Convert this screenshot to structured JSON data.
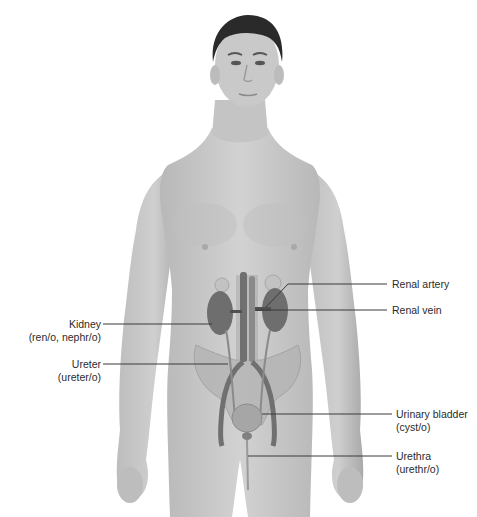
{
  "figure": {
    "colors": {
      "skin": "#c8c8c8",
      "skin_shade": "#b3b3b3",
      "hair": "#2a2a2a",
      "organ_dark": "#6e6e6e",
      "organ_mid": "#9a9a9a",
      "leader_line": "#3a3a3a",
      "text": "#2b2b2b"
    }
  },
  "labels": {
    "left": [
      {
        "name": "Kidney",
        "combining_form": "(ren/o, nephr/o)"
      },
      {
        "name": "Ureter",
        "combining_form": "(ureter/o)"
      }
    ],
    "right": [
      {
        "name": "Renal artery",
        "combining_form": ""
      },
      {
        "name": "Renal vein",
        "combining_form": ""
      },
      {
        "name": "Urinary bladder",
        "combining_form": "(cyst/o)"
      },
      {
        "name": "Urethra",
        "combining_form": "(urethr/o)"
      }
    ]
  }
}
